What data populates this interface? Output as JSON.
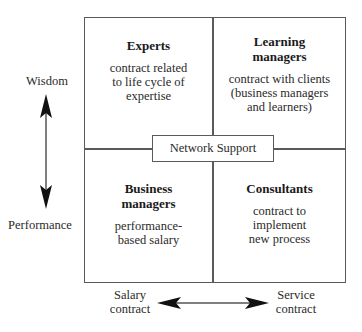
{
  "diagram": {
    "quadrants": {
      "top_left": {
        "title": "Experts",
        "description": "contract related to life cycle of expertise"
      },
      "top_right": {
        "title": "Learning managers",
        "description": "contract with clients (business managers and learners)"
      },
      "bottom_left": {
        "title": "Business managers",
        "description": "performance-based salary"
      },
      "bottom_right": {
        "title": "Consultants",
        "description": "contract to implement new process"
      }
    },
    "center_label": "Network Support",
    "vertical_axis": {
      "top_label": "Wisdom",
      "bottom_label": "Performance",
      "icon": "double-headed-vertical-arrow"
    },
    "horizontal_axis": {
      "left_label": "Salary contract",
      "right_label": "Service contract",
      "icon": "double-headed-horizontal-arrow"
    },
    "colors": {
      "line": "#5a5a5a",
      "text": "#1e1e1e",
      "arrow": "#111111",
      "background": "#ffffff"
    }
  }
}
